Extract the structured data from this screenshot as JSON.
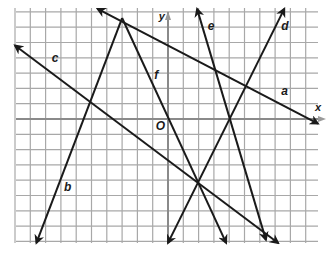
{
  "diagram": {
    "type": "coordinate-grid-with-lines",
    "axes": {
      "x_label": "x",
      "y_label": "y",
      "origin_label": "O"
    },
    "grid": {
      "x_min": -10,
      "x_max": 10,
      "y_min": -8,
      "y_max": 7
    },
    "lines": [
      {
        "id": "a",
        "label": "a",
        "from": [
          -4.6,
          7.2
        ],
        "to": [
          9.8,
          -0.3
        ],
        "arrows": "both"
      },
      {
        "id": "b",
        "label": "b",
        "from": [
          -3,
          6.6
        ],
        "to": [
          -8.6,
          -8.1
        ],
        "arrows": "end"
      },
      {
        "id": "c",
        "label": "c",
        "from": [
          -10,
          4.8
        ],
        "to": [
          7.2,
          -8.1
        ],
        "arrows": "both"
      },
      {
        "id": "d",
        "label": "d",
        "from": [
          7.6,
          7.2
        ],
        "to": [
          0,
          -8.1
        ],
        "arrows": "both"
      },
      {
        "id": "e",
        "label": "e",
        "from": [
          1.9,
          7.2
        ],
        "to": [
          6.4,
          -7.9
        ],
        "arrows": "both"
      },
      {
        "id": "f",
        "label": "f",
        "from": [
          -3,
          6.6
        ],
        "to": [
          3.8,
          -8.1
        ],
        "arrows": "end"
      }
    ],
    "label_positions": {
      "a": [
        7.4,
        1.6
      ],
      "b": [
        -6.8,
        -4.7
      ],
      "c": [
        -7.6,
        3.7
      ],
      "d": [
        7.4,
        5.8
      ],
      "e": [
        2.6,
        5.8
      ],
      "f": [
        -0.9,
        2.6
      ],
      "O": [
        -0.8,
        -0.7
      ],
      "x": [
        9.6,
        0.5
      ],
      "y": [
        -0.6,
        6.5
      ]
    }
  }
}
